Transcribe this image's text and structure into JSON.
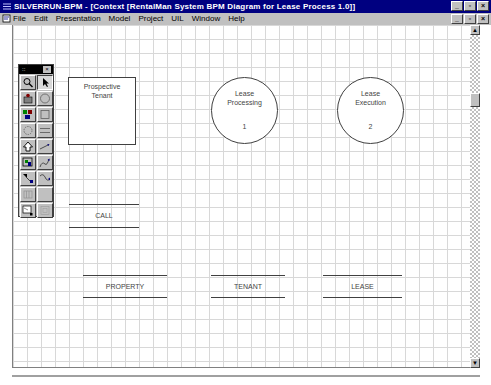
{
  "window": {
    "title": "SILVERRUN-BPM - [Context [RentalMan System BPM Diagram for Lease Process 1.0]]",
    "controls": {
      "minimize": "_",
      "restore": "▫",
      "close": "×"
    }
  },
  "menubar": {
    "items": [
      {
        "label": "File"
      },
      {
        "label": "Edit"
      },
      {
        "label": "Presentation"
      },
      {
        "label": "Model"
      },
      {
        "label": "Project"
      },
      {
        "label": "UIL"
      },
      {
        "label": "Window"
      },
      {
        "label": "Help"
      }
    ]
  },
  "palette": {
    "close": "×",
    "tools": [
      {
        "name": "zoom-tool",
        "icon": "magnifier-icon"
      },
      {
        "name": "select-tool",
        "icon": "arrow-pointer-icon",
        "selected": true
      },
      {
        "name": "external-entity-tool",
        "icon": "entity-icon"
      },
      {
        "name": "process-tool",
        "icon": "circle-icon"
      },
      {
        "name": "entity-group-tool",
        "icon": "entity-group-icon"
      },
      {
        "name": "square-tool",
        "icon": "square-icon"
      },
      {
        "name": "process-group-tool",
        "icon": "dashed-circle-icon"
      },
      {
        "name": "datastore-tool",
        "icon": "datastore-icon"
      },
      {
        "name": "up-arrow-tool",
        "icon": "up-arrow-icon"
      },
      {
        "name": "flow-tool",
        "icon": "flow-arrow-icon"
      },
      {
        "name": "multi-entity-tool",
        "icon": "multi-entity-icon"
      },
      {
        "name": "curved-flow-tool",
        "icon": "curved-flow-icon"
      },
      {
        "name": "link-tool",
        "icon": "link-icon"
      },
      {
        "name": "loop-flow-tool",
        "icon": "loop-flow-icon"
      },
      {
        "name": "disabled-tool-1",
        "icon": "columns-icon"
      },
      {
        "name": "disabled-tool-2",
        "icon": "blank-icon"
      },
      {
        "name": "note-tool",
        "icon": "note-icon"
      },
      {
        "name": "disabled-tool-3",
        "icon": "frame-icon"
      }
    ]
  },
  "diagram": {
    "entities": [
      {
        "label": "Prospective Tenant"
      }
    ],
    "processes": [
      {
        "label": "Lease Processing",
        "number": "1"
      },
      {
        "label": "Lease Execution",
        "number": "2"
      }
    ],
    "datastores": [
      {
        "label": "CALL"
      },
      {
        "label": "PROPERTY"
      },
      {
        "label": "TENANT"
      },
      {
        "label": "LEASE"
      }
    ]
  },
  "scrollbar": {
    "up": "▲",
    "down": "▼"
  },
  "colors": {
    "titlebar": "#000080",
    "chrome": "#c0c0c0",
    "grid": "#d8d8d8"
  }
}
